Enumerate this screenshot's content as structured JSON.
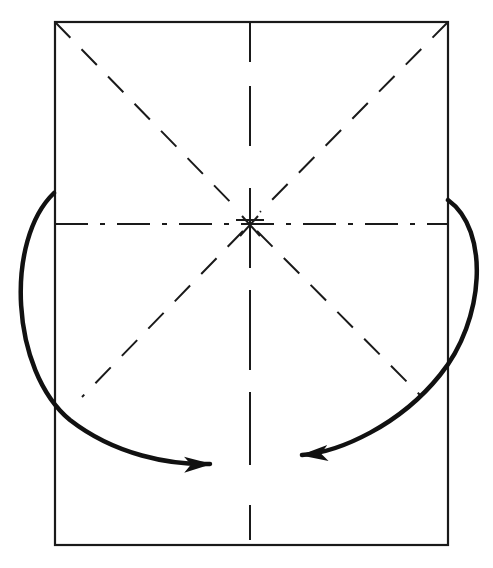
{
  "diagram": {
    "type": "origami-fold-diagram",
    "colors": {
      "background": "#ffffff",
      "line": "#1a1a1a",
      "arrow": "#111111"
    },
    "paper": {
      "x": 55,
      "y": 22,
      "width": 393,
      "height": 523
    },
    "center": {
      "x": 250,
      "y": 224
    },
    "creases": [
      {
        "name": "vertical-valley-fold",
        "style": "dashed",
        "from": [
          250,
          22
        ],
        "to": [
          250,
          545
        ]
      },
      {
        "name": "horizontal-mountain-fold",
        "style": "dash-dot",
        "from": [
          55,
          224
        ],
        "to": [
          448,
          224
        ]
      },
      {
        "name": "diagonal-top-left",
        "style": "dashed",
        "from": [
          55,
          22
        ],
        "to": [
          250,
          224
        ]
      },
      {
        "name": "diagonal-top-right",
        "style": "dashed",
        "from": [
          448,
          22
        ],
        "to": [
          250,
          224
        ]
      },
      {
        "name": "diagonal-bottom-left",
        "style": "dashed",
        "from": [
          250,
          224
        ],
        "to": [
          82,
          397
        ]
      },
      {
        "name": "diagonal-bottom-right",
        "style": "dashed",
        "from": [
          250,
          224
        ],
        "to": [
          422,
          397
        ]
      }
    ],
    "arrows": [
      {
        "name": "left-fold-arrow",
        "direction": "fold left edge toward center-bottom",
        "start": [
          54,
          193
        ],
        "end": [
          228,
          467
        ]
      },
      {
        "name": "right-fold-arrow",
        "direction": "fold right edge toward center-bottom",
        "start": [
          448,
          200
        ],
        "end": [
          285,
          455
        ]
      }
    ]
  }
}
